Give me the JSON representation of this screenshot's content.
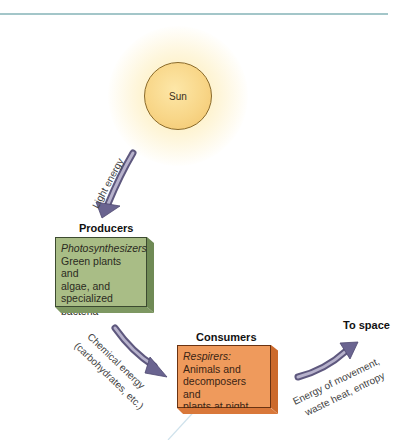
{
  "diagram": {
    "sun": {
      "label": "Sun"
    },
    "producers": {
      "heading": "Producers",
      "role": "Photosynthesizers:",
      "description_lines": [
        "Green plants and",
        "algae, and",
        "specialized",
        "bacteria"
      ]
    },
    "consumers": {
      "heading": "Consumers",
      "role": "Respirers:",
      "description_lines": [
        "Animals and",
        "decomposers and",
        "plants at night"
      ]
    },
    "space": {
      "heading": "To space"
    },
    "arrows": {
      "light": {
        "label": "Light energy"
      },
      "chemical": {
        "label_line1": "Chemical energy",
        "label_line2": "(carbohydrates, etc.)"
      },
      "outflow": {
        "label_line1": "Energy of movement,",
        "label_line2": "waste heat, entropy"
      }
    },
    "colors": {
      "rule": "#a3c6c9",
      "sun": "#f8d688",
      "producer": "#a9bd86",
      "consumer": "#ef9a5c",
      "arrow": "#6e6890"
    }
  }
}
